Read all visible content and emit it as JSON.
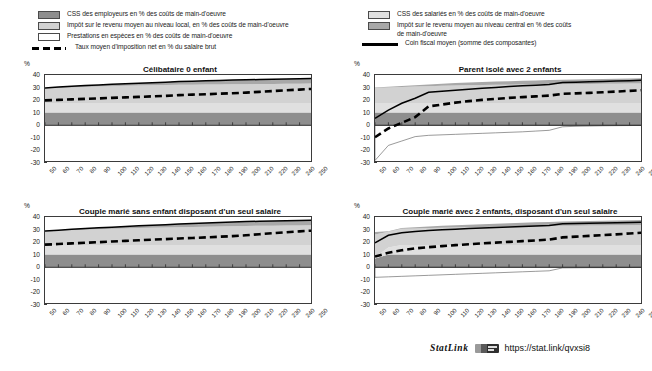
{
  "legend_left": [
    {
      "swatch": "sw-emp",
      "label": "CSS des employeurs en % des coûts de main-d'oeuvre",
      "type": "swatch"
    },
    {
      "swatch": "sw-local",
      "label": "Impôt sur le revenu moyen au niveau local, en % des coûts de main-d'oeuvre",
      "type": "swatch"
    },
    {
      "swatch": "sw-prest",
      "label": "Prestations en espèces en % des coûts de main-d'oeuvre",
      "type": "swatch"
    },
    {
      "swatch": "dashed",
      "label": "Taux moyen d'imposition net en % du salaire brut",
      "type": "line"
    }
  ],
  "legend_right": [
    {
      "swatch": "sw-sal",
      "label": "CSS des salariés en % des coûts de main-d'oeuvre",
      "type": "swatch"
    },
    {
      "swatch": "sw-central",
      "label": "Impôt sur le revenu moyen au niveau central en %  des coûts\nde main-d'oeuvre",
      "type": "swatch"
    },
    {
      "swatch": "solid",
      "label": "Coin fiscal moyen (somme des composantes)",
      "type": "line"
    }
  ],
  "axis": {
    "unit": "%",
    "yticks": [
      40,
      30,
      20,
      10,
      0,
      -10,
      -20,
      -30
    ],
    "ylim": [
      -30,
      40
    ],
    "xticks": [
      50,
      60,
      70,
      80,
      90,
      100,
      110,
      120,
      130,
      140,
      150,
      160,
      170,
      180,
      190,
      200,
      210,
      220,
      230,
      240,
      250
    ],
    "xlim": [
      50,
      250
    ]
  },
  "footer": {
    "statlink_word": "StatLink",
    "statlink_icon": "statlink-badge-icon",
    "url": "https://stat.link/qvxsi8"
  },
  "chart_data": [
    {
      "id": "celibataire-0-enfant",
      "type": "area",
      "title": "Célibataire 0 enfant",
      "xlabel": "",
      "ylabel": "%",
      "xlim": [
        50,
        250
      ],
      "ylim": [
        -30,
        40
      ],
      "grid": false,
      "x": [
        50,
        60,
        70,
        80,
        90,
        100,
        110,
        120,
        130,
        140,
        150,
        160,
        170,
        180,
        190,
        200,
        210,
        220,
        230,
        240,
        250
      ],
      "series": [
        {
          "name": "CSS des employeurs en % des coûts de main-d'oeuvre",
          "stack": "positive",
          "color": "#8e8e8e",
          "values": [
            10.2,
            10.2,
            10.2,
            10.2,
            10.2,
            10.2,
            10.2,
            10.2,
            10.2,
            10.2,
            10.2,
            10.2,
            10.2,
            10.2,
            10.2,
            10.2,
            10.2,
            10.2,
            10.2,
            10.2,
            10.2
          ]
        },
        {
          "name": "CSS des salariés en % des coûts de main-d'oeuvre",
          "stack": "positive",
          "color": "#e0e0e0",
          "values": [
            7.5,
            7.5,
            7.5,
            7.5,
            7.5,
            7.5,
            7.5,
            7.5,
            7.5,
            7.5,
            7.5,
            7.5,
            7.5,
            7.5,
            7.5,
            7.5,
            7.5,
            7.5,
            7.5,
            7.5,
            7.5
          ]
        },
        {
          "name": "Impôt sur le revenu moyen au niveau local, en % des coûts de main-d'oeuvre",
          "stack": "positive",
          "color": "#d2d2d2",
          "values": [
            11.5,
            12.0,
            12.4,
            12.8,
            13.1,
            13.4,
            13.7,
            13.9,
            14.1,
            14.3,
            14.5,
            14.6,
            14.7,
            14.8,
            14.9,
            15.0,
            15.1,
            15.2,
            15.3,
            15.4,
            15.5
          ]
        },
        {
          "name": "Impôt sur le revenu moyen au niveau central en % des coûts de main-d'oeuvre",
          "stack": "positive",
          "color": "#a8a8a8",
          "values": [
            0.5,
            0.7,
            0.9,
            1.1,
            1.3,
            1.5,
            1.7,
            1.9,
            2.1,
            2.3,
            2.6,
            2.8,
            3.0,
            3.2,
            3.4,
            3.5,
            3.6,
            3.7,
            3.8,
            3.9,
            4.0
          ]
        },
        {
          "name": "Prestations en espèces en % des coûts de main-d'oeuvre",
          "stack": "negative",
          "color": "#ffffff",
          "values": [
            0,
            0,
            0,
            0,
            0,
            0,
            0,
            0,
            0,
            0,
            0,
            0,
            0,
            0,
            0,
            0,
            0,
            0,
            0,
            0,
            0
          ]
        }
      ],
      "lines": [
        {
          "name": "Coin fiscal moyen (somme des composantes)",
          "style": "solid",
          "color": "#000000",
          "values": [
            29.7,
            30.4,
            31.0,
            31.6,
            32.1,
            32.6,
            33.1,
            33.5,
            33.9,
            34.3,
            34.8,
            35.1,
            35.4,
            35.7,
            36.0,
            36.2,
            36.4,
            36.6,
            36.8,
            37.0,
            37.2
          ]
        },
        {
          "name": "Taux moyen d'imposition net en % du salaire brut",
          "style": "dashed",
          "color": "#000000",
          "values": [
            19.8,
            20.2,
            20.6,
            21.0,
            21.4,
            21.8,
            22.2,
            22.6,
            23.0,
            23.4,
            24.0,
            24.4,
            24.7,
            25.1,
            25.5,
            26.0,
            26.6,
            27.2,
            27.8,
            28.4,
            29.0
          ]
        }
      ]
    },
    {
      "id": "parent-isole-2-enfants",
      "type": "area",
      "title": "Parent isolé avec 2 enfants",
      "xlabel": "",
      "ylabel": "%",
      "xlim": [
        50,
        250
      ],
      "ylim": [
        -30,
        40
      ],
      "grid": false,
      "x": [
        50,
        60,
        70,
        80,
        90,
        100,
        110,
        120,
        130,
        140,
        150,
        160,
        170,
        180,
        190,
        200,
        210,
        220,
        230,
        240,
        250
      ],
      "series": [
        {
          "name": "CSS des employeurs en % des coûts de main-d'oeuvre",
          "stack": "positive",
          "color": "#8e8e8e",
          "values": [
            10.2,
            10.2,
            10.2,
            10.2,
            10.2,
            10.2,
            10.2,
            10.2,
            10.2,
            10.2,
            10.2,
            10.2,
            10.2,
            10.2,
            10.2,
            10.2,
            10.2,
            10.2,
            10.2,
            10.2,
            10.2
          ]
        },
        {
          "name": "CSS des salariés en % des coûts de main-d'oeuvre",
          "stack": "positive",
          "color": "#e0e0e0",
          "values": [
            7.5,
            7.5,
            7.5,
            7.5,
            7.5,
            7.5,
            7.5,
            7.5,
            7.5,
            7.5,
            7.5,
            7.5,
            7.5,
            7.5,
            7.5,
            7.5,
            7.5,
            7.5,
            7.5,
            7.5,
            7.5
          ]
        },
        {
          "name": "Impôt sur le revenu moyen au niveau local, en % des coûts de main-d'oeuvre",
          "stack": "positive",
          "color": "#d2d2d2",
          "values": [
            12.0,
            12.4,
            12.8,
            13.1,
            13.4,
            13.7,
            13.9,
            14.1,
            14.3,
            14.5,
            14.6,
            14.7,
            14.8,
            14.9,
            15.0,
            15.1,
            15.2,
            15.3,
            15.4,
            15.5,
            15.6
          ]
        },
        {
          "name": "Impôt sur le revenu moyen au niveau central en % des coûts de main-d'oeuvre",
          "stack": "positive",
          "color": "#a8a8a8",
          "values": [
            0.3,
            0.5,
            0.8,
            1.1,
            1.4,
            1.7,
            2.0,
            2.2,
            2.4,
            2.6,
            2.8,
            3.0,
            3.2,
            3.4,
            3.6,
            3.7,
            3.8,
            3.9,
            4.0,
            4.1,
            4.2
          ]
        },
        {
          "name": "Prestations en espèces en % des coûts de main-d'oeuvre",
          "stack": "negative",
          "color": "#ffffff",
          "values": [
            -28.0,
            -16.0,
            -12.5,
            -9.0,
            -8.0,
            -7.6,
            -7.2,
            -6.8,
            -6.4,
            -6.0,
            -5.6,
            -5.2,
            -4.6,
            -4.0,
            -1.2,
            -0.8,
            -0.6,
            -0.4,
            -0.3,
            -0.2,
            -0.1
          ]
        }
      ],
      "lines": [
        {
          "name": "Coin fiscal moyen (somme des composantes)",
          "style": "solid",
          "color": "#000000",
          "values": [
            5.5,
            12.0,
            17.5,
            21.5,
            26.2,
            27.0,
            27.8,
            28.6,
            29.4,
            30.1,
            30.8,
            31.4,
            31.9,
            32.4,
            34.0,
            34.3,
            34.6,
            34.9,
            35.2,
            35.5,
            35.8
          ]
        },
        {
          "name": "Taux moyen d'imposition net en % du salaire brut",
          "style": "dashed",
          "color": "#000000",
          "values": [
            -9.5,
            -2.5,
            2.0,
            6.5,
            15.0,
            16.5,
            18.0,
            19.2,
            20.2,
            21.0,
            21.8,
            22.4,
            23.0,
            23.6,
            25.0,
            25.4,
            25.8,
            26.3,
            26.8,
            27.4,
            28.0
          ]
        }
      ]
    },
    {
      "id": "couple-marie-sans-enfant",
      "type": "area",
      "title": "Couple marié sans enfant disposant d'un seul salaire",
      "xlabel": "",
      "ylabel": "%",
      "xlim": [
        50,
        250
      ],
      "ylim": [
        -30,
        40
      ],
      "grid": false,
      "x": [
        50,
        60,
        70,
        80,
        90,
        100,
        110,
        120,
        130,
        140,
        150,
        160,
        170,
        180,
        190,
        200,
        210,
        220,
        230,
        240,
        250
      ],
      "series": [
        {
          "name": "CSS des employeurs en % des coûts de main-d'oeuvre",
          "stack": "positive",
          "color": "#8e8e8e",
          "values": [
            10.2,
            10.2,
            10.2,
            10.2,
            10.2,
            10.2,
            10.2,
            10.2,
            10.2,
            10.2,
            10.2,
            10.2,
            10.2,
            10.2,
            10.2,
            10.2,
            10.2,
            10.2,
            10.2,
            10.2,
            10.2
          ]
        },
        {
          "name": "CSS des salariés en % des coûts de main-d'oeuvre",
          "stack": "positive",
          "color": "#e0e0e0",
          "values": [
            7.5,
            7.5,
            7.5,
            7.5,
            7.5,
            7.5,
            7.5,
            7.5,
            7.5,
            7.5,
            7.5,
            7.5,
            7.5,
            7.5,
            7.5,
            7.5,
            7.5,
            7.5,
            7.5,
            7.5,
            7.5
          ]
        },
        {
          "name": "Impôt sur le revenu moyen au niveau local, en % des coûts de main-d'oeuvre",
          "stack": "positive",
          "color": "#d2d2d2",
          "values": [
            10.8,
            11.3,
            11.8,
            12.2,
            12.6,
            12.9,
            13.2,
            13.5,
            13.8,
            14.0,
            14.2,
            14.4,
            14.6,
            14.8,
            15.0,
            15.2,
            15.3,
            15.4,
            15.5,
            15.6,
            15.7
          ]
        },
        {
          "name": "Impôt sur le revenu moyen au niveau central en % des coûts de main-d'oeuvre",
          "stack": "positive",
          "color": "#a8a8a8",
          "values": [
            0.3,
            0.5,
            0.7,
            0.9,
            1.1,
            1.3,
            1.6,
            1.8,
            2.0,
            2.2,
            2.5,
            2.7,
            2.9,
            3.1,
            3.3,
            3.5,
            3.6,
            3.7,
            3.8,
            3.9,
            4.0
          ]
        },
        {
          "name": "Prestations en espèces en % des coûts de main-d'oeuvre",
          "stack": "negative",
          "color": "#ffffff",
          "values": [
            0,
            0,
            0,
            0,
            0,
            0,
            0,
            0,
            0,
            0,
            0,
            0,
            0,
            0,
            0,
            0,
            0,
            0,
            0,
            0,
            0
          ]
        }
      ],
      "lines": [
        {
          "name": "Coin fiscal moyen (somme des composantes)",
          "style": "solid",
          "color": "#000000",
          "values": [
            28.8,
            29.5,
            30.2,
            30.8,
            31.4,
            31.9,
            32.5,
            33.0,
            33.5,
            33.9,
            34.4,
            34.8,
            35.2,
            35.6,
            36.0,
            36.4,
            36.6,
            36.8,
            37.0,
            37.2,
            37.4
          ]
        },
        {
          "name": "Taux moyen d'imposition net en % du salaire brut",
          "style": "dashed",
          "color": "#000000",
          "values": [
            18.0,
            18.5,
            19.0,
            19.5,
            20.0,
            20.5,
            21.0,
            21.5,
            22.0,
            22.4,
            22.9,
            23.3,
            23.8,
            24.3,
            24.8,
            25.5,
            26.3,
            27.1,
            27.9,
            28.6,
            29.2
          ]
        }
      ]
    },
    {
      "id": "couple-marie-2-enfants",
      "type": "area",
      "title": "Couple marié avec 2 enfants, disposant d'un seul salaire",
      "xlabel": "",
      "ylabel": "%",
      "xlim": [
        50,
        250
      ],
      "ylim": [
        -30,
        40
      ],
      "grid": false,
      "x": [
        50,
        60,
        70,
        80,
        90,
        100,
        110,
        120,
        130,
        140,
        150,
        160,
        170,
        180,
        190,
        200,
        210,
        220,
        230,
        240,
        250
      ],
      "series": [
        {
          "name": "CSS des employeurs en % des coûts de main-d'oeuvre",
          "stack": "positive",
          "color": "#8e8e8e",
          "values": [
            7.0,
            10.2,
            10.2,
            10.2,
            10.2,
            10.2,
            10.2,
            10.2,
            10.2,
            10.2,
            10.2,
            10.2,
            10.2,
            10.2,
            10.2,
            10.2,
            10.2,
            10.2,
            10.2,
            10.2,
            10.2
          ]
        },
        {
          "name": "CSS des salariés en % des coûts de main-d'oeuvre",
          "stack": "positive",
          "color": "#e0e0e0",
          "values": [
            1.0,
            5.5,
            7.5,
            7.5,
            7.5,
            7.5,
            7.5,
            7.5,
            7.5,
            7.5,
            7.5,
            7.5,
            7.5,
            7.5,
            7.5,
            7.5,
            7.5,
            7.5,
            7.5,
            7.5,
            7.5
          ]
        },
        {
          "name": "Impôt sur le revenu moyen au niveau local, en % des coûts de main-d'oeuvre",
          "stack": "positive",
          "color": "#d2d2d2",
          "values": [
            18.0,
            12.5,
            12.9,
            13.2,
            13.5,
            13.8,
            14.0,
            14.2,
            14.4,
            14.6,
            14.8,
            15.0,
            15.1,
            15.2,
            15.3,
            15.4,
            15.5,
            15.6,
            15.7,
            15.8,
            15.9
          ]
        },
        {
          "name": "Impôt sur le revenu moyen au niveau central en % des coûts de main-d'oeuvre",
          "stack": "positive",
          "color": "#a8a8a8",
          "values": [
            2.0,
            0.4,
            0.6,
            0.9,
            1.2,
            1.5,
            1.8,
            2.0,
            2.2,
            2.4,
            2.6,
            2.8,
            3.0,
            3.2,
            3.4,
            3.6,
            3.7,
            3.8,
            3.9,
            4.0,
            4.1
          ]
        },
        {
          "name": "Prestations en espèces en % des coûts de main-d'oeuvre",
          "stack": "negative",
          "color": "#ffffff",
          "values": [
            -8.0,
            -7.6,
            -7.2,
            -6.8,
            -6.4,
            -6.0,
            -5.6,
            -5.2,
            -4.8,
            -4.4,
            -4.0,
            -3.6,
            -3.2,
            -2.8,
            -0.5,
            -0.4,
            -0.3,
            -0.3,
            -0.2,
            -0.2,
            -0.1
          ]
        }
      ],
      "lines": [
        {
          "name": "Coin fiscal moyen (somme des composantes)",
          "style": "solid",
          "color": "#000000",
          "values": [
            19.5,
            25.5,
            27.5,
            28.5,
            29.2,
            29.8,
            30.3,
            30.8,
            31.2,
            31.6,
            32.0,
            32.4,
            32.8,
            33.2,
            34.6,
            34.9,
            35.1,
            35.3,
            35.5,
            35.7,
            35.9
          ]
        },
        {
          "name": "Taux moyen d'imposition net en % du salaire brut",
          "style": "dashed",
          "color": "#000000",
          "values": [
            8.5,
            11.5,
            13.5,
            15.0,
            16.0,
            16.8,
            17.6,
            18.3,
            19.0,
            19.6,
            20.2,
            20.8,
            21.4,
            22.0,
            23.8,
            24.4,
            25.0,
            25.6,
            26.2,
            26.9,
            27.6
          ]
        }
      ]
    }
  ]
}
